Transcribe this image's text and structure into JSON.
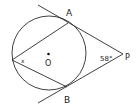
{
  "diagram": {
    "title": "",
    "points": {
      "A": {
        "label": "A"
      },
      "B": {
        "label": "B"
      },
      "P": {
        "label": "P"
      },
      "O": {
        "label": "O"
      }
    },
    "angles": {
      "at_P": {
        "label": "58°",
        "value_degrees": 58
      },
      "inscribed": {
        "label": "x"
      }
    }
  }
}
